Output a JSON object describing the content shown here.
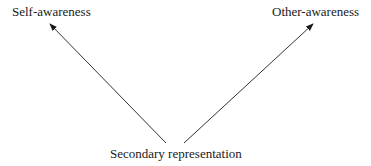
{
  "diagram": {
    "nodes": {
      "self_awareness": "Self-awareness",
      "other_awareness": "Other-awareness",
      "secondary_representation": "Secondary representation"
    },
    "edges": [
      {
        "from": "Secondary representation",
        "to": "Self-awareness"
      },
      {
        "from": "Secondary representation",
        "to": "Other-awareness"
      }
    ],
    "colors": {
      "line": "#333333",
      "text": "#1a1a1a",
      "background": "#ffffff"
    }
  }
}
